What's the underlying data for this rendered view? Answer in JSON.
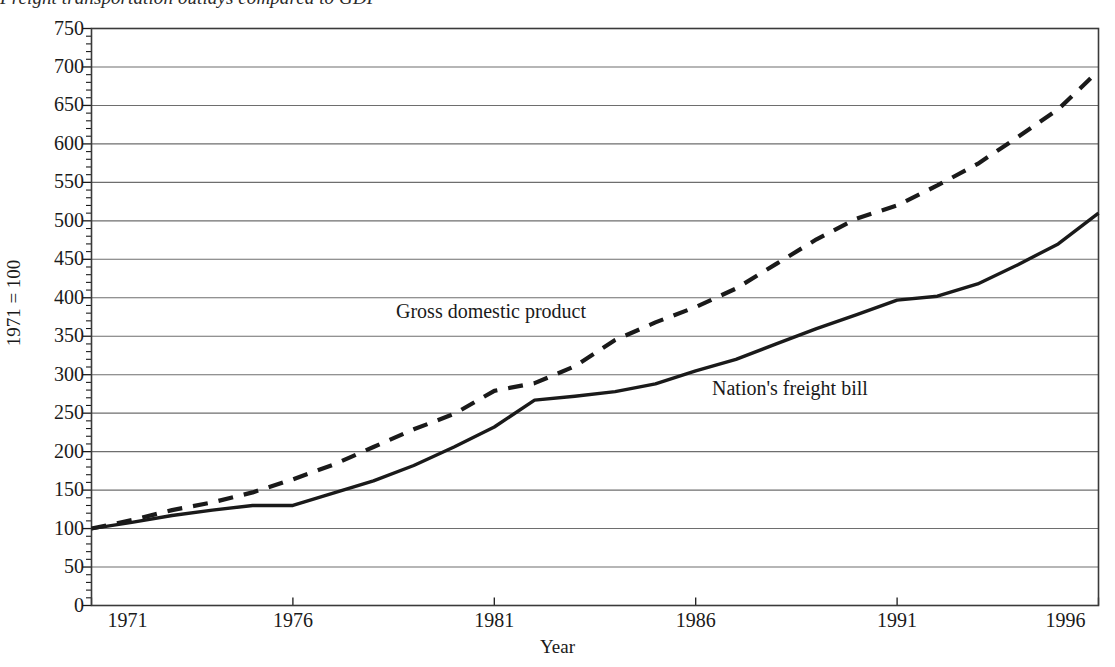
{
  "chart_data": {
    "type": "line",
    "title": "Freight transportation outlays compared to GDP",
    "xlabel": "Year",
    "ylabel": "1971 = 100",
    "xlim": [
      1971,
      1996
    ],
    "ylim": [
      0,
      750
    ],
    "xticks": [
      "1971",
      "1976",
      "1981",
      "1986",
      "1991",
      "1996"
    ],
    "xtick_values": [
      1971,
      1976,
      1981,
      1986,
      1991,
      1996
    ],
    "yticks": [
      "0",
      "50",
      "100",
      "150",
      "200",
      "250",
      "300",
      "350",
      "400",
      "450",
      "500",
      "550",
      "600",
      "650",
      "700",
      "750"
    ],
    "ytick_values": [
      0,
      50,
      100,
      150,
      200,
      250,
      300,
      350,
      400,
      450,
      500,
      550,
      600,
      650,
      700,
      750
    ],
    "y_minor_step": 10,
    "grid": "horizontal",
    "legend": "inline-annotations",
    "x": [
      1971,
      1972,
      1973,
      1974,
      1975,
      1976,
      1977,
      1978,
      1979,
      1980,
      1981,
      1982,
      1983,
      1984,
      1985,
      1986,
      1987,
      1988,
      1989,
      1990,
      1991,
      1992,
      1993,
      1994,
      1995,
      1996
    ],
    "series": [
      {
        "name": "Gross domestic product",
        "style": "dashed",
        "color": "#1a1a1a",
        "values": [
          100,
          111,
          124,
          134,
          147,
          164,
          183,
          206,
          229,
          249,
          279,
          289,
          311,
          345,
          368,
          388,
          412,
          444,
          476,
          503,
          520,
          546,
          574,
          609,
          645,
          695
        ]
      },
      {
        "name": "Nation's freight bill",
        "style": "solid",
        "color": "#1a1a1a",
        "values": [
          100,
          108,
          117,
          124,
          130,
          130,
          146,
          162,
          182,
          206,
          232,
          267,
          272,
          278,
          288,
          305,
          320,
          340,
          360,
          378,
          397,
          402,
          418,
          443,
          470,
          510
        ]
      }
    ],
    "annotations": [
      {
        "text": "Gross domestic product",
        "x": 1980.2,
        "y": 372
      },
      {
        "text": "Nation's freight bill",
        "x": 1988.5,
        "y": 275
      }
    ]
  },
  "axis": {
    "ylabel": "1971 = 100",
    "xlabel": "Year"
  }
}
